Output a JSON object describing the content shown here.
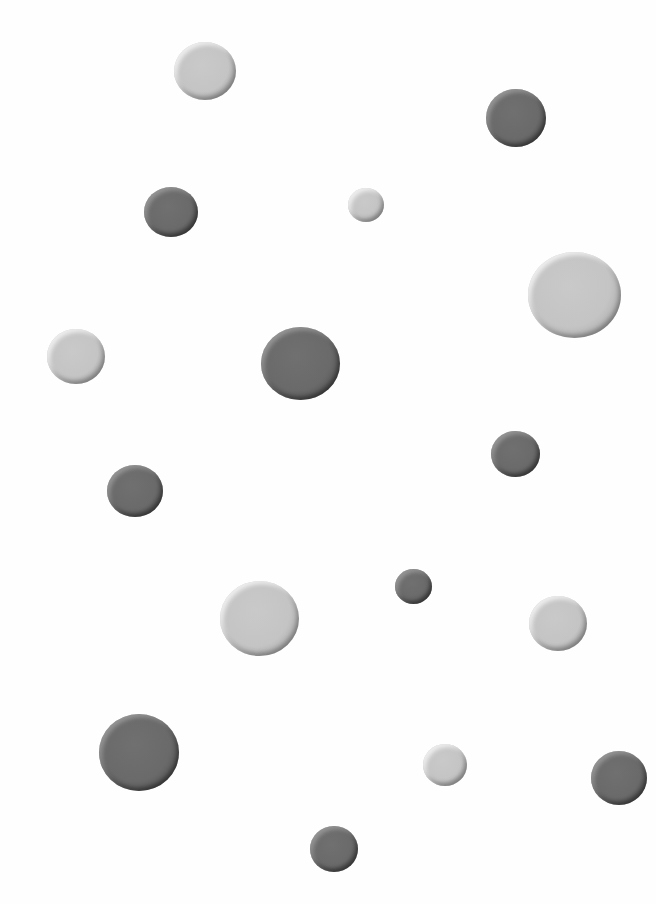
{
  "scene": {
    "description": "Scattered embossed gray dots on white background",
    "background": "#fefefe",
    "colors": {
      "light": "#c4c4c4",
      "dark": "#6a6a6a"
    },
    "dots": [
      {
        "x": 174,
        "y": 42,
        "w": 62,
        "h": 58,
        "tone": "light"
      },
      {
        "x": 486,
        "y": 89,
        "w": 60,
        "h": 58,
        "tone": "dark"
      },
      {
        "x": 144,
        "y": 187,
        "w": 54,
        "h": 50,
        "tone": "dark"
      },
      {
        "x": 348,
        "y": 188,
        "w": 36,
        "h": 34,
        "tone": "light"
      },
      {
        "x": 528,
        "y": 252,
        "w": 93,
        "h": 86,
        "tone": "light"
      },
      {
        "x": 47,
        "y": 329,
        "w": 58,
        "h": 55,
        "tone": "light"
      },
      {
        "x": 261,
        "y": 327,
        "w": 79,
        "h": 73,
        "tone": "dark"
      },
      {
        "x": 491,
        "y": 431,
        "w": 49,
        "h": 46,
        "tone": "dark"
      },
      {
        "x": 107,
        "y": 465,
        "w": 56,
        "h": 52,
        "tone": "dark"
      },
      {
        "x": 220,
        "y": 581,
        "w": 79,
        "h": 75,
        "tone": "light"
      },
      {
        "x": 395,
        "y": 569,
        "w": 37,
        "h": 35,
        "tone": "dark"
      },
      {
        "x": 529,
        "y": 596,
        "w": 58,
        "h": 55,
        "tone": "light"
      },
      {
        "x": 99,
        "y": 714,
        "w": 80,
        "h": 77,
        "tone": "dark"
      },
      {
        "x": 423,
        "y": 744,
        "w": 44,
        "h": 42,
        "tone": "light"
      },
      {
        "x": 591,
        "y": 751,
        "w": 56,
        "h": 54,
        "tone": "dark"
      },
      {
        "x": 310,
        "y": 826,
        "w": 48,
        "h": 46,
        "tone": "dark"
      }
    ]
  }
}
